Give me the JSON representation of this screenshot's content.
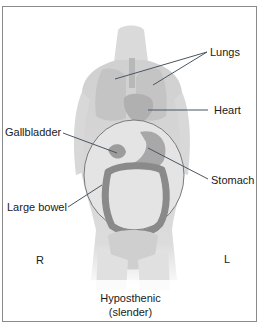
{
  "figure": {
    "labels": {
      "lungs": "Lungs",
      "heart": "Heart",
      "gallbladder": "Gallbladder",
      "stomach": "Stomach",
      "large_bowel": "Large bowel",
      "right": "R",
      "left": "L"
    },
    "caption": {
      "line1": "Hyposthenic",
      "line2": "(slender)"
    },
    "colors": {
      "border": "#8a8a8a",
      "leader_line": "#4a5560",
      "body_shade": "#c8c8c8",
      "organ_shade": "#9a9a9a"
    }
  }
}
